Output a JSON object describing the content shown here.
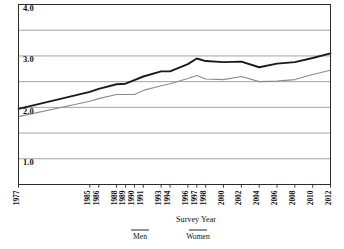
{
  "chart_data": {
    "type": "line",
    "title": "",
    "xlabel": "Survey Year",
    "ylabel": "",
    "grid": true,
    "legend_position": "bottom",
    "xlim_note": "categorical year axis with gap between 1977 and 1985",
    "ylim": [
      0.5,
      4.0
    ],
    "yticks": [
      1.0,
      2.0,
      3.0,
      4.0
    ],
    "ytick_labels": [
      "1.0",
      "2.0",
      "3.0",
      "4.0"
    ],
    "ygrid_values": [
      0.5,
      1.0,
      1.5,
      2.0,
      2.5,
      3.0,
      3.5,
      4.0
    ],
    "categories": [
      "1977",
      "1985",
      "1986",
      "1988",
      "1989",
      "1990",
      "1991",
      "1993",
      "1994",
      "1996",
      "1997",
      "1998",
      "2000",
      "2002",
      "2004",
      "2006",
      "2008",
      "2010",
      "2012"
    ],
    "x_positions": [
      0,
      8,
      9,
      11,
      12,
      13,
      14,
      16,
      17,
      19,
      20,
      21,
      23,
      25,
      27,
      29,
      31,
      33,
      35
    ],
    "series": [
      {
        "name": "Men",
        "color": "#1a1a1a",
        "width": 1.9,
        "values": [
          1.97,
          2.3,
          2.36,
          2.45,
          2.46,
          2.53,
          2.6,
          2.7,
          2.7,
          2.84,
          2.95,
          2.9,
          2.88,
          2.89,
          2.78,
          2.85,
          2.88,
          2.96,
          3.05
        ]
      },
      {
        "name": "Women",
        "color": "#8c8c8c",
        "width": 1.1,
        "values": [
          1.82,
          2.12,
          2.17,
          2.25,
          2.25,
          2.25,
          2.33,
          2.42,
          2.46,
          2.56,
          2.62,
          2.55,
          2.54,
          2.6,
          2.5,
          2.51,
          2.54,
          2.64,
          2.72
        ]
      }
    ],
    "legend": [
      {
        "label": "Men",
        "color": "#6f6f6f"
      },
      {
        "label": "Women",
        "color": "#6f6f6f"
      }
    ],
    "frame_color": "#2b2b2b",
    "grid_color": "#9a9a9a"
  }
}
